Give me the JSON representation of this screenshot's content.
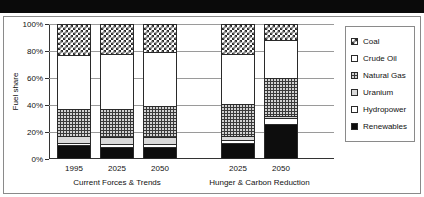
{
  "chart_data": {
    "type": "bar",
    "subtype": "stacked-100-percent",
    "title": "",
    "xlabel": "",
    "ylabel": "Fuel share",
    "ylim": [
      0,
      100
    ],
    "ytick_labels": [
      "0%",
      "20%",
      "40%",
      "60%",
      "80%",
      "100%"
    ],
    "ytick_values": [
      0,
      20,
      40,
      60,
      80,
      100
    ],
    "grid": true,
    "legend_position": "right",
    "categories": [
      "1995",
      "2025",
      "2050",
      "2025",
      "2050"
    ],
    "groups": [
      {
        "label": "Current Forces & Trends",
        "categories": [
          "1995",
          "2025",
          "2050"
        ]
      },
      {
        "label": "Hunger & Carbon Reduction",
        "categories": [
          "2025",
          "2050"
        ]
      }
    ],
    "series": [
      {
        "name": "Renewables",
        "pattern": "solid-black",
        "values": [
          10,
          9,
          9,
          12,
          26
        ]
      },
      {
        "name": "Hydropower",
        "pattern": "white",
        "values": [
          2,
          2,
          2,
          2,
          4
        ]
      },
      {
        "name": "Uranium",
        "pattern": "light-gray",
        "values": [
          5,
          5,
          5,
          3,
          2
        ]
      },
      {
        "name": "Natural Gas",
        "pattern": "dark-dotted",
        "values": [
          20,
          21,
          23,
          24,
          28
        ]
      },
      {
        "name": "Crude Oil",
        "pattern": "white",
        "values": [
          40,
          41,
          40,
          37,
          28
        ]
      },
      {
        "name": "Coal",
        "pattern": "checkerboard",
        "values": [
          23,
          22,
          21,
          22,
          12
        ]
      }
    ]
  },
  "legend": {
    "items": [
      {
        "label": "Coal",
        "swatch": "checkerboard-swatch"
      },
      {
        "label": "Crude Oil",
        "swatch": "white-swatch"
      },
      {
        "label": "Natural Gas",
        "swatch": "dark-dotted-swatch"
      },
      {
        "label": "Uranium",
        "swatch": "light-gray-swatch"
      },
      {
        "label": "Hydropower",
        "swatch": "white-swatch"
      },
      {
        "label": "Renewables",
        "swatch": "solid-black-swatch"
      }
    ]
  },
  "colors": {
    "frame": "#8a8a8a",
    "axis": "#333333",
    "gridline": "#9a9a9a",
    "renewables": "#0d0d0d",
    "uranium": "#d9d9d9",
    "natural_gas": "#3a3a3a",
    "background": "#ffffff",
    "top_band": "#0a0a0a"
  }
}
